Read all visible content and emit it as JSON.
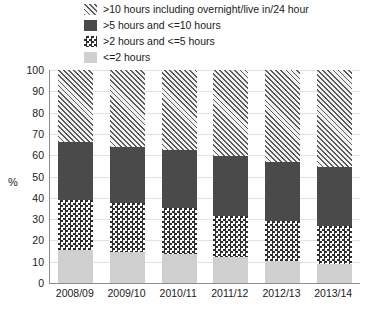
{
  "chart_data": {
    "type": "bar",
    "subtype": "stacked-bar-percent",
    "title": "",
    "xlabel": "",
    "ylabel": "%",
    "ylim": [
      0,
      100
    ],
    "yticks": [
      100,
      90,
      80,
      70,
      60,
      50,
      40,
      30,
      20,
      10,
      0
    ],
    "grid": true,
    "legend_position": "top",
    "categories": [
      "2008/09",
      "2009/10",
      "2010/11",
      "2011/12",
      "2012/13",
      "2013/14"
    ],
    "series": [
      {
        "name": "<=2 hours",
        "pattern": "light-gray-solid",
        "color": "#cfcfcf",
        "values": [
          15.5,
          14.5,
          13.5,
          12.0,
          10.5,
          9.0
        ]
      },
      {
        "name": ">2 hours and <=5 hours",
        "pattern": "checkerboard",
        "color": "#2e2e2e",
        "values": [
          23.5,
          23.0,
          21.5,
          19.5,
          18.5,
          18.0
        ]
      },
      {
        "name": ">5 hours and <=10 hours",
        "pattern": "dark-gray-solid",
        "color": "#4a4a4a",
        "values": [
          27.0,
          26.5,
          27.5,
          28.0,
          28.0,
          27.5
        ]
      },
      {
        "name": ">10 hours including overnight/live in/24 hour",
        "pattern": "diagonal-hatch",
        "color": "#5a5a5a",
        "values": [
          34.0,
          36.0,
          37.5,
          40.5,
          43.0,
          45.5
        ]
      }
    ],
    "cumulative_tops": [
      [
        15.5,
        39.0,
        66.0,
        100.0
      ],
      [
        14.5,
        37.5,
        64.0,
        100.0
      ],
      [
        13.5,
        35.0,
        62.5,
        100.0
      ],
      [
        12.0,
        31.5,
        59.5,
        100.0
      ],
      [
        10.5,
        29.0,
        57.0,
        100.0
      ],
      [
        9.0,
        27.0,
        54.5,
        100.0
      ]
    ]
  },
  "legend": {
    "items": [
      {
        "label": ">10 hours including overnight/live in/24 hour",
        "pattern": "pat-hatch"
      },
      {
        "label": ">5 hours and <=10 hours",
        "pattern": "pat-solid-dark"
      },
      {
        "label": ">2 hours and <=5 hours",
        "pattern": "pat-check"
      },
      {
        "label": "<=2 hours",
        "pattern": "pat-light"
      }
    ]
  },
  "axes": {
    "y_title": "%"
  }
}
